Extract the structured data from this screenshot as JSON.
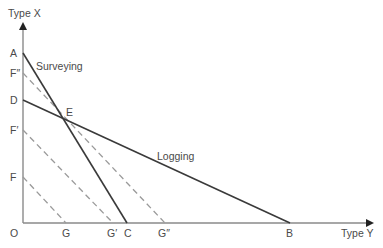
{
  "diagram": {
    "axes": {
      "y_label": "Type X",
      "x_label": "Type Y",
      "origin_label": "O"
    },
    "y_axis_points": {
      "A": "A",
      "F2": "F″",
      "D": "D",
      "F1": "F′",
      "F": "F"
    },
    "x_axis_points": {
      "G": "G",
      "G1": "G′",
      "C": "C",
      "G2": "G″",
      "B": "B"
    },
    "intersection_label": "E",
    "lines": {
      "surveying": {
        "label": "Surveying",
        "from": "A",
        "to": "C",
        "style": "solid"
      },
      "logging": {
        "label": "Logging",
        "from": "D",
        "to": "B",
        "style": "solid"
      },
      "iso_1": {
        "from": "F",
        "to": "G",
        "style": "dashed"
      },
      "iso_2": {
        "from": "F′",
        "to": "G′",
        "style": "dashed"
      },
      "iso_3": {
        "from": "F″",
        "to": "G″",
        "style": "dashed"
      }
    },
    "colors": {
      "solid_line": "#3a3a3a",
      "dashed_line": "#9a9a9a",
      "axis": "#8a8a8a",
      "text": "#4a4a4a"
    }
  }
}
